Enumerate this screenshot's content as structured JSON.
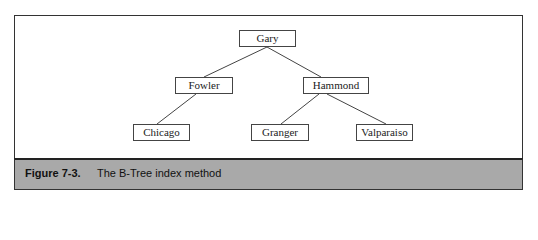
{
  "diagram": {
    "type": "b-tree",
    "nodes": {
      "root": "Gary",
      "left": "Fowler",
      "right": "Hammond",
      "left_left": "Chicago",
      "right_left": "Granger",
      "right_right": "Valparaiso"
    },
    "edges": [
      [
        "Gary",
        "Fowler"
      ],
      [
        "Gary",
        "Hammond"
      ],
      [
        "Fowler",
        "Chicago"
      ],
      [
        "Hammond",
        "Granger"
      ],
      [
        "Hammond",
        "Valparaiso"
      ]
    ]
  },
  "caption": {
    "label": "Figure 7-3.",
    "text": "The B-Tree index method",
    "background": "#a9a9a9"
  }
}
